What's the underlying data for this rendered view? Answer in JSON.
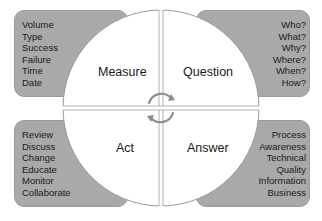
{
  "diagram": {
    "center_icon": "refresh-cycle-icon",
    "quadrants": [
      {
        "id": "measure",
        "label": "Measure",
        "items": [
          "Volume",
          "Type",
          "Success",
          "Failure",
          "Time",
          "Date"
        ]
      },
      {
        "id": "question",
        "label": "Question",
        "items": [
          "Who?",
          "What?",
          "Why?",
          "Where?",
          "When?",
          "How?"
        ]
      },
      {
        "id": "act",
        "label": "Act",
        "items": [
          "Review",
          "Discuss",
          "Change",
          "Educate",
          "Monitor",
          "Collaborate"
        ]
      },
      {
        "id": "answer",
        "label": "Answer",
        "items": [
          "Process",
          "Awareness",
          "Technical",
          "Quality",
          "Information",
          "Business"
        ]
      }
    ],
    "colors": {
      "box_fill": "#a9a9a9",
      "circle_fill": "#ffffff",
      "outline": "#9a9a9a",
      "icon": "#8c8c8c"
    }
  }
}
